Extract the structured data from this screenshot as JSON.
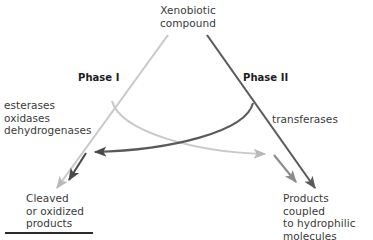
{
  "diagram": {
    "title": "Xenobiotic\ncompound",
    "phases": [
      {
        "id": "phase1",
        "name": "Phase I",
        "enzymes": "esterases\noxidases\ndehydrogenases",
        "product": "Cleaved\nor oxidized\nproducts",
        "color": "#c9c9c9"
      },
      {
        "id": "phase2",
        "name": "Phase II",
        "enzymes": "transferases",
        "product": "Products coupled\nto hydrophilic\nmolecules",
        "color": "#5a5a5a"
      }
    ],
    "colors": {
      "phase1_stroke": "#c9c9c9",
      "phase2_stroke": "#5a5a5a",
      "phase1_arrow": "#8c8c8c",
      "phase2_arrow": "#4a4a4a",
      "text": "#3a3a3a",
      "rule": "#2b2b2b",
      "background": "#ffffff"
    },
    "rule_label": ""
  }
}
